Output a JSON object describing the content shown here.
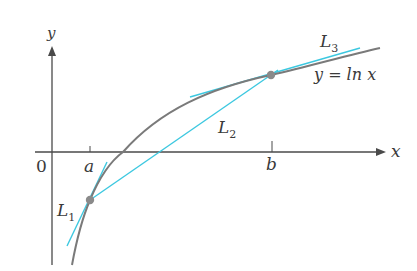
{
  "figure": {
    "function_label": "y = ln x",
    "axis_x_label": "x",
    "axis_y_label": "y",
    "origin_label": "0",
    "point_a_label": "a",
    "point_b_label": "b",
    "line1_label": "L",
    "line1_sub": "1",
    "line2_label": "L",
    "line2_sub": "2",
    "line3_label": "L",
    "line3_sub": "3"
  },
  "colors": {
    "curve": "#7a7a7a",
    "tangent": "#3cc8e0",
    "axis": "#4a4a4a",
    "point": "#8a8a8a"
  }
}
